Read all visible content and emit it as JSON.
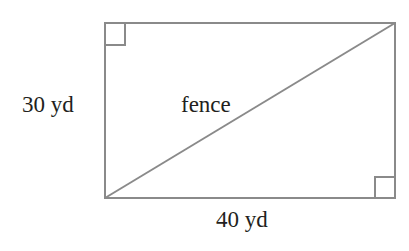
{
  "figure": {
    "shape": "rectangle",
    "labels": {
      "left_side": "30 yd",
      "bottom_side": "40 yd",
      "diagonal": "fence"
    },
    "right_angle_markers": [
      "top-left",
      "bottom-right"
    ],
    "colors": {
      "line": "#8a8a8a",
      "text": "#231f20",
      "background": "#ffffff"
    }
  }
}
